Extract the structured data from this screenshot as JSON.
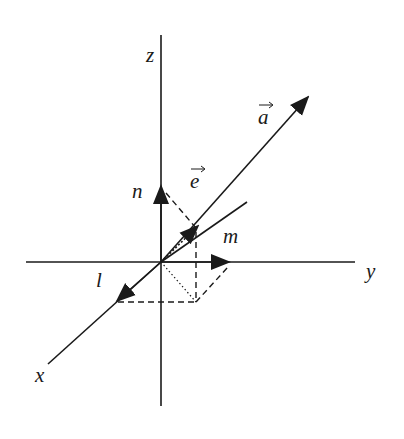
{
  "diagram": {
    "type": "3d-coordinate-vector-diagram",
    "axes": {
      "x_label": "x",
      "y_label": "y",
      "z_label": "z"
    },
    "vectors": {
      "a_label": "a",
      "e_label": "e"
    },
    "components": {
      "l_label": "l",
      "m_label": "m",
      "n_label": "n"
    },
    "colors": {
      "stroke": "#1a1a1a",
      "background": "#ffffff"
    }
  }
}
